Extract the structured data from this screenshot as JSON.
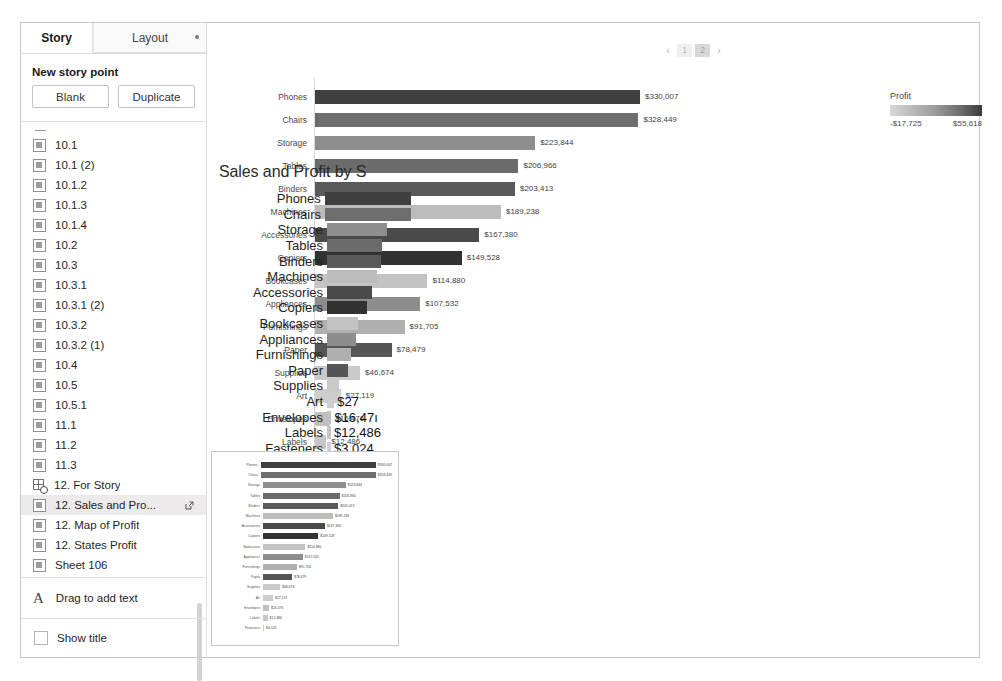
{
  "sidebar": {
    "tabs": [
      {
        "label": "Story",
        "active": true
      },
      {
        "label": "Layout",
        "active": false
      }
    ],
    "new_story_point_label": "New story point",
    "buttons": {
      "blank": "Blank",
      "duplicate": "Duplicate"
    },
    "story_points": [
      {
        "label": "10.1",
        "icon": "sheet-icon",
        "selected": false
      },
      {
        "label": "10.1 (2)",
        "icon": "sheet-icon",
        "selected": false
      },
      {
        "label": "10.1.2",
        "icon": "sheet-icon",
        "selected": false
      },
      {
        "label": "10.1.3",
        "icon": "sheet-icon",
        "selected": false
      },
      {
        "label": "10.1.4",
        "icon": "sheet-icon",
        "selected": false
      },
      {
        "label": "10.2",
        "icon": "sheet-icon",
        "selected": false
      },
      {
        "label": "10.3",
        "icon": "sheet-icon",
        "selected": false
      },
      {
        "label": "10.3.1",
        "icon": "sheet-icon",
        "selected": false
      },
      {
        "label": "10.3.1 (2)",
        "icon": "sheet-icon",
        "selected": false
      },
      {
        "label": "10.3.2",
        "icon": "sheet-icon",
        "selected": false
      },
      {
        "label": "10.3.2 (1)",
        "icon": "sheet-icon",
        "selected": false
      },
      {
        "label": "10.4",
        "icon": "sheet-icon",
        "selected": false
      },
      {
        "label": "10.5",
        "icon": "sheet-icon",
        "selected": false
      },
      {
        "label": "10.5.1",
        "icon": "sheet-icon",
        "selected": false
      },
      {
        "label": "11.1",
        "icon": "sheet-icon",
        "selected": false
      },
      {
        "label": "11.2",
        "icon": "sheet-icon",
        "selected": false
      },
      {
        "label": "11.3",
        "icon": "sheet-icon",
        "selected": false
      },
      {
        "label": "12. For Story",
        "icon": "dashboard-icon",
        "selected": false
      },
      {
        "label": "12. Sales and Pro...",
        "icon": "sheet-icon",
        "selected": true
      },
      {
        "label": "12. Map of Profit",
        "icon": "sheet-icon",
        "selected": false
      },
      {
        "label": "12. States Profit",
        "icon": "sheet-icon",
        "selected": false
      },
      {
        "label": "Sheet 106",
        "icon": "sheet-icon",
        "selected": false
      }
    ],
    "drag_to_add_text": "Drag to add text",
    "show_title": "Show title"
  },
  "pager": {
    "prev": "‹",
    "next": "›",
    "pages": [
      "1",
      "2"
    ],
    "active": "2"
  },
  "overlay": {
    "title": "Sales and Profit by S"
  },
  "chart_data": {
    "type": "bar",
    "xlabel": "Sales",
    "ylabel": "Sub-Category",
    "orientation": "horizontal",
    "grid": false,
    "xlim": [
      0,
      330007
    ],
    "categories": [
      "Phones",
      "Chairs",
      "Storage",
      "Tables",
      "Binders",
      "Machines",
      "Accessories",
      "Copiers",
      "Bookcases",
      "Appliances",
      "Furnishings",
      "Paper",
      "Supplies",
      "Art",
      "Envelopes",
      "Labels",
      "Fasteners"
    ],
    "values": [
      330007,
      328449,
      223844,
      206966,
      203413,
      189238,
      167380,
      149528,
      114880,
      107532,
      91705,
      78479,
      46674,
      27119,
      16476,
      12486,
      3024
    ],
    "value_labels": [
      "$330,007",
      "$328,449",
      "$223,844",
      "$206,966",
      "$203,413",
      "$189,238",
      "$167,380",
      "$149,528",
      "$114,880",
      "$107,532",
      "$91,705",
      "$78,479",
      "$46,674",
      "$27,119",
      "$16,476",
      "$12,486",
      "$3,024"
    ],
    "colors": [
      "#3f3f3f",
      "#6e6e6e",
      "#8e8e8e",
      "#6b6b6b",
      "#5a5a5a",
      "#bcbcbc",
      "#4a4a4a",
      "#323232",
      "#c3c3c3",
      "#8d8d8d",
      "#b0b0b0",
      "#565656",
      "#c9c9c9",
      "#cdcdcd",
      "#c0c0c0",
      "#c6c6c6",
      "#cfcfcf"
    ],
    "color_encoding": "Profit",
    "legend": {
      "title": "Profit",
      "min_label": "-$17,725",
      "max_label": "$55,618",
      "min": -17725,
      "max": 55618,
      "position": "right",
      "gradient_from": "#d8d8d8",
      "gradient_to": "#3c3c3c"
    },
    "overlay_value_labels": [
      "",
      "",
      "",
      "",
      "",
      "",
      "",
      "",
      "",
      "",
      "",
      "",
      "",
      "$27",
      "$16,47ı",
      "$12,486",
      "$3,024"
    ]
  }
}
